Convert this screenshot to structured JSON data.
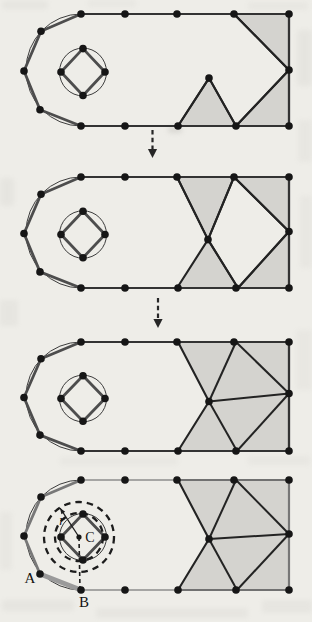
{
  "diagram": {
    "canvas": {
      "width": 312,
      "height": 622,
      "background": "#eeede8"
    },
    "colors": {
      "triangle_fill": "#d4d3cf",
      "triangle_edge": "#232323",
      "boundary_edge": "#333333",
      "boundary_chord": "#4d4d4d",
      "muted_edge": "#8d8d8d",
      "muted_chord": "#787878",
      "front_highlight": "#9a9a9a",
      "node_fill": "#161616",
      "thin_geometry": "#3c3c3c",
      "annotation": "#1d1d1d",
      "arrow": "#262626",
      "label_text": "#121212"
    },
    "base": {
      "top_dots_x": [
        81,
        125,
        177,
        234,
        289
      ],
      "bottom_dots_x": [
        81,
        125,
        178,
        236,
        289
      ],
      "arc_nodes": [
        [
          81,
          0
        ],
        [
          41,
          17
        ],
        [
          24,
          56
        ],
        [
          40,
          94
        ],
        [
          81,
          110
        ]
      ],
      "right_x": 289,
      "height": 110,
      "arc": {
        "cx": 81,
        "cy": 55,
        "r": 55
      },
      "hole": {
        "cx": 83,
        "cy": 57,
        "r": 23.5,
        "diamond": [
          [
            83,
            34
          ],
          [
            105,
            57
          ],
          [
            83,
            80
          ],
          [
            61,
            57
          ]
        ]
      }
    },
    "panels": [
      {
        "name": "step-1",
        "top": 14,
        "bottom": 126,
        "right_mid_y": 55,
        "gray": [
          [
            [
              234,
              0
            ],
            [
              289,
              0
            ],
            [
              289,
              55
            ]
          ],
          [
            [
              209,
              63
            ],
            [
              178,
              110
            ],
            [
              236,
              110
            ]
          ],
          [
            [
              236,
              110
            ],
            [
              289,
              55
            ],
            [
              289,
              110
            ]
          ]
        ],
        "edges": [
          [
            [
              234,
              0
            ],
            [
              289,
              55
            ]
          ],
          [
            [
              209,
              63
            ],
            [
              178,
              110
            ]
          ],
          [
            [
              209,
              63
            ],
            [
              236,
              110
            ]
          ],
          [
            [
              236,
              110
            ],
            [
              289,
              55
            ]
          ]
        ],
        "extra_nodes": [
          [
            209,
            63
          ]
        ]
      },
      {
        "name": "step-2",
        "top": 177,
        "bottom": 288,
        "right_mid_y": 54,
        "gray": [
          [
            [
              177,
              0
            ],
            [
              234,
              0
            ],
            [
              208,
              62
            ]
          ],
          [
            [
              234,
              0
            ],
            [
              289,
              0
            ],
            [
              289,
              54
            ]
          ],
          [
            [
              177,
              110
            ],
            [
              208,
              62
            ],
            [
              238,
              110
            ]
          ],
          [
            [
              238,
              110
            ],
            [
              289,
              54
            ],
            [
              289,
              110
            ]
          ]
        ],
        "edges": [
          [
            [
              177,
              0
            ],
            [
              208,
              62
            ]
          ],
          [
            [
              234,
              0
            ],
            [
              208,
              62
            ]
          ],
          [
            [
              234,
              0
            ],
            [
              289,
              54
            ]
          ],
          [
            [
              208,
              62
            ],
            [
              238,
              110
            ]
          ],
          [
            [
              238,
              110
            ],
            [
              289,
              54
            ]
          ]
        ],
        "extra_nodes": [
          [
            208,
            62
          ]
        ]
      },
      {
        "name": "step-3",
        "top": 342,
        "bottom": 451,
        "right_mid_y": 52,
        "gray": [
          [
            [
              178,
              0
            ],
            [
              289,
              0
            ],
            [
              289,
              110
            ],
            [
              178,
              110
            ],
            [
              209,
              60
            ]
          ]
        ],
        "edges": [
          [
            [
              236,
              0
            ],
            [
              209,
              60
            ]
          ],
          [
            [
              236,
              0
            ],
            [
              289,
              52
            ]
          ],
          [
            [
              209,
              60
            ],
            [
              289,
              52
            ]
          ],
          [
            [
              209,
              60
            ],
            [
              237,
              110
            ]
          ],
          [
            [
              237,
              110
            ],
            [
              289,
              52
            ]
          ]
        ],
        "extra_nodes": [
          [
            209,
            60
          ]
        ]
      },
      {
        "name": "step-4",
        "top": 480,
        "bottom": 590,
        "right_mid_y": 54,
        "muted": true,
        "gray": [
          [
            [
              178,
              0
            ],
            [
              289,
              0
            ],
            [
              289,
              110
            ],
            [
              178,
              110
            ],
            [
              209,
              59
            ]
          ]
        ],
        "edges": [
          [
            [
              236,
              0
            ],
            [
              209,
              59
            ]
          ],
          [
            [
              236,
              0
            ],
            [
              289,
              54
            ]
          ],
          [
            [
              209,
              59
            ],
            [
              289,
              54
            ]
          ],
          [
            [
              209,
              59
            ],
            [
              237,
              110
            ]
          ],
          [
            [
              237,
              110
            ],
            [
              289,
              54
            ]
          ]
        ],
        "extra_nodes": [
          [
            209,
            59
          ]
        ],
        "annotations": {
          "front_edge": [
            [
              40,
              94
            ],
            [
              81,
              110
            ]
          ],
          "dashed_circles": [
            {
              "cx": 79,
              "cy": 57,
              "r": 24
            },
            {
              "cx": 79,
              "cy": 57,
              "r": 35
            }
          ],
          "center_point": {
            "x": 79,
            "y": 57,
            "label": "C",
            "label_x": 90,
            "label_y": 62
          },
          "radius_arrow": {
            "x1": 79,
            "y1": 57,
            "x2": 60,
            "y2": 28,
            "label": "r",
            "label_x": 62,
            "label_y": 45
          },
          "dashed_line": [
            [
              79,
              57
            ],
            [
              80,
              110
            ]
          ],
          "point_labels": [
            {
              "text": "A",
              "x": 30,
              "y": 103
            },
            {
              "text": "B",
              "x": 84,
              "y": 127
            }
          ]
        }
      }
    ],
    "flow_arrows": [
      {
        "x": 152.5,
        "y1": 130,
        "y2": 158
      },
      {
        "x": 158,
        "y1": 298,
        "y2": 328
      }
    ],
    "scan_artifacts": [
      {
        "x": 2,
        "y": 1,
        "w": 46,
        "h": 8,
        "o": 0.1
      },
      {
        "x": 88,
        "y": 0,
        "w": 48,
        "h": 7,
        "o": 0.08
      },
      {
        "x": 248,
        "y": 2,
        "w": 60,
        "h": 8,
        "o": 0.08
      },
      {
        "x": 297,
        "y": 30,
        "w": 15,
        "h": 56,
        "o": 0.1
      },
      {
        "x": 298,
        "y": 120,
        "w": 14,
        "h": 42,
        "o": 0.08
      },
      {
        "x": 0,
        "y": 178,
        "w": 14,
        "h": 28,
        "o": 0.1
      },
      {
        "x": 300,
        "y": 196,
        "w": 12,
        "h": 72,
        "o": 0.08
      },
      {
        "x": 168,
        "y": 126,
        "w": 14,
        "h": 7,
        "o": 0.25
      },
      {
        "x": 0,
        "y": 300,
        "w": 18,
        "h": 26,
        "o": 0.09
      },
      {
        "x": 296,
        "y": 330,
        "w": 16,
        "h": 60,
        "o": 0.07
      },
      {
        "x": 60,
        "y": 457,
        "w": 118,
        "h": 8,
        "o": 0.07
      },
      {
        "x": 248,
        "y": 456,
        "w": 62,
        "h": 9,
        "o": 0.08
      },
      {
        "x": 0,
        "y": 512,
        "w": 12,
        "h": 58,
        "o": 0.08
      },
      {
        "x": 2,
        "y": 600,
        "w": 72,
        "h": 11,
        "o": 0.1
      },
      {
        "x": 96,
        "y": 608,
        "w": 152,
        "h": 10,
        "o": 0.09
      },
      {
        "x": 262,
        "y": 600,
        "w": 50,
        "h": 13,
        "o": 0.09
      }
    ]
  }
}
